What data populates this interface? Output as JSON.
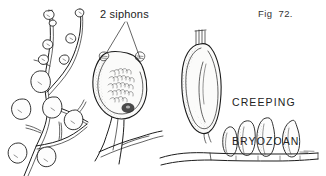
{
  "figure": {
    "background_color": "#ffffff",
    "ink_color": "#1a1a1a",
    "labels": {
      "siphons": "2 siphons",
      "figure_number": "Fig  72.",
      "common_name_line1": "CREEPING",
      "common_name_line2": "BRYOZOAN"
    },
    "parts": {
      "branching_colony": "branching-stolon-colony",
      "main_zooid": "large-zooid-with-siphons",
      "upright_zooid": "upright-ovoid-zooid",
      "zooid_cluster": "creeping-stolon-zooid-cluster",
      "creeping_stolon": "horizontal-creeping-stolon"
    }
  }
}
